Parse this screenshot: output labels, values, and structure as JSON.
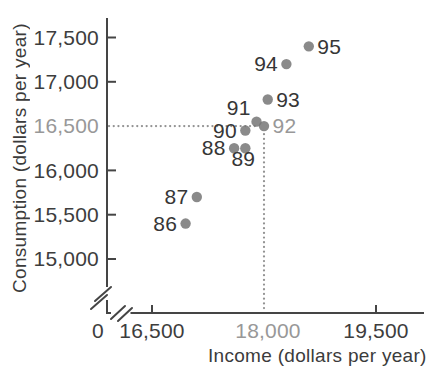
{
  "chart_data": {
    "type": "scatter",
    "title": "",
    "xlabel": "Income (dollars per year)",
    "ylabel": "Consumption (dollars per year)",
    "x_axis": {
      "zero_label": "0",
      "range": [
        16500,
        19500
      ],
      "broken_axis": true,
      "ticks": [
        {
          "value": 16500,
          "label": "16,500",
          "highlighted": false,
          "tick_mark": true
        },
        {
          "value": 18000,
          "label": "18,000",
          "highlighted": true,
          "tick_mark": false
        },
        {
          "value": 19500,
          "label": "19,500",
          "highlighted": false,
          "tick_mark": true
        }
      ]
    },
    "y_axis": {
      "range": [
        15000,
        17500
      ],
      "broken_axis": true,
      "ticks": [
        {
          "value": 17500,
          "label": "17,500",
          "highlighted": false,
          "tick_mark": true
        },
        {
          "value": 17000,
          "label": "17,000",
          "highlighted": false,
          "tick_mark": true
        },
        {
          "value": 16500,
          "label": "16,500",
          "highlighted": true,
          "tick_mark": false
        },
        {
          "value": 16000,
          "label": "16,000",
          "highlighted": false,
          "tick_mark": true
        },
        {
          "value": 15500,
          "label": "15,500",
          "highlighted": false,
          "tick_mark": true
        },
        {
          "value": 15000,
          "label": "15,000",
          "highlighted": false,
          "tick_mark": true
        }
      ]
    },
    "points": [
      {
        "year": "86",
        "income": 16950,
        "consumption": 15400,
        "label_side": "left",
        "highlighted": false
      },
      {
        "year": "87",
        "income": 17100,
        "consumption": 15700,
        "label_side": "left",
        "highlighted": false
      },
      {
        "year": "88",
        "income": 17600,
        "consumption": 16250,
        "label_side": "left",
        "highlighted": false
      },
      {
        "year": "89",
        "income": 17750,
        "consumption": 16250,
        "label_side": "below",
        "highlighted": false
      },
      {
        "year": "90",
        "income": 17750,
        "consumption": 16450,
        "label_side": "left",
        "highlighted": false
      },
      {
        "year": "91",
        "income": 17900,
        "consumption": 16550,
        "label_side": "above-left",
        "highlighted": false
      },
      {
        "year": "92",
        "income": 18000,
        "consumption": 16500,
        "label_side": "right",
        "highlighted": true
      },
      {
        "year": "93",
        "income": 18050,
        "consumption": 16800,
        "label_side": "right",
        "highlighted": false
      },
      {
        "year": "94",
        "income": 18300,
        "consumption": 17200,
        "label_side": "left",
        "highlighted": false
      },
      {
        "year": "95",
        "income": 18600,
        "consumption": 17400,
        "label_side": "right",
        "highlighted": false
      }
    ],
    "reference_lines": {
      "income": 18000,
      "consumption": 16500,
      "style": "dotted"
    },
    "colors": {
      "point": "#757575",
      "axis": "#454545",
      "tick_label": "#3d3d3d",
      "highlight_label": "#989898",
      "dotted_line": "#929292",
      "point_label": "#363636"
    },
    "legend": {
      "visible": false
    },
    "grid": false
  }
}
